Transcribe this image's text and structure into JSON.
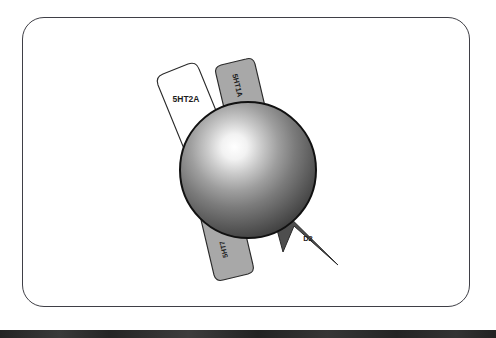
{
  "figure": {
    "frame": {
      "border_color": "#3f3f46",
      "background_color": "#ffffff",
      "corner_radius": 22
    },
    "bottom_bar": {
      "color": "#2b2b2b"
    },
    "sphere": {
      "name": "central-sphere",
      "center_x": 248,
      "center_y": 170,
      "radius": 68,
      "highlight_color": "#ffffff",
      "mid_color": "#8a8a8a",
      "edge_color": "#3a3a3a",
      "outline_color": "#111111"
    },
    "receptors": [
      {
        "id": "5ht1a",
        "label": "5HT1A",
        "shape": "rounded-tab",
        "fill": "#a8a8a8",
        "stroke": "#2a2a2a",
        "text_color": "#1c1c1c",
        "rotation_deg": 105,
        "position": "top"
      },
      {
        "id": "5ht2a",
        "label": "5HT2A",
        "shape": "rounded-tab",
        "fill": "#ffffff",
        "stroke": "#2a2a2a",
        "text_color": "#1c1c1c",
        "rotation_deg": 0,
        "position": "upper-left"
      },
      {
        "id": "5ht7",
        "label": "5HT7",
        "shape": "rounded-tab",
        "fill": "#a8a8a8",
        "stroke": "#2a2a2a",
        "text_color": "#1c1c1c",
        "rotation_deg": 250,
        "position": "bottom"
      },
      {
        "id": "d2",
        "label": "D2",
        "shape": "arrow-wedge",
        "fill": "#4e4e4e",
        "stroke": "#2a2a2a",
        "text_color": "#1c1c1c",
        "rotation_deg": 0,
        "position": "lower-right"
      }
    ]
  }
}
